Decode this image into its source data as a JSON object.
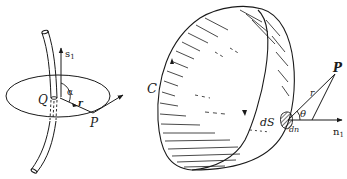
{
  "figure": {
    "background": "#ffffff",
    "ink_color": "#1a1a1a",
    "left_panel": {
      "description": "Curved tube (current-carrying wire) passing through a disk, with unit tangent s1 at point Q and position vector r to point P",
      "labels": {
        "s1": "s",
        "s1_sub": "1",
        "Q": "Q",
        "alpha": "α",
        "r": "r",
        "P": "P"
      }
    },
    "right_panel": {
      "description": "Hemispherical cap surface bounded by closed curve C, with surface element dS, normal n1, distance r to point P and angle θ",
      "labels": {
        "C": "C",
        "P": "P",
        "r": "r",
        "theta": "θ",
        "dS": "dS",
        "dn": "dn",
        "n1": "n",
        "n1_sub": "1"
      }
    }
  }
}
